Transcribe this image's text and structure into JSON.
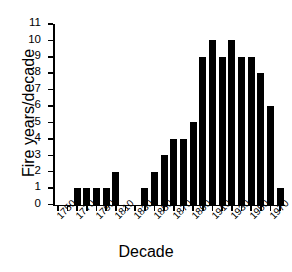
{
  "chart_data": {
    "type": "bar",
    "title": "",
    "xlabel": "Decade",
    "ylabel": "Fire years/decade",
    "categories": [
      1750,
      1760,
      1770,
      1780,
      1790,
      1800,
      1810,
      1820,
      1830,
      1840,
      1850,
      1860,
      1870,
      1880,
      1890,
      1900,
      1910,
      1920,
      1930,
      1940,
      1950,
      1960,
      1970,
      1980
    ],
    "values": [
      0,
      0,
      1,
      1,
      1,
      1,
      2,
      0,
      0,
      1,
      2,
      3,
      4,
      4,
      5,
      9,
      10,
      9,
      10,
      9,
      9,
      8,
      6,
      1
    ],
    "ylim": [
      0,
      11
    ],
    "xlim": [
      1745,
      1985
    ],
    "ytick_labels": [
      "0",
      "1",
      "2",
      "3",
      "4",
      "5",
      "6",
      "7",
      "8",
      "9",
      "10",
      "11"
    ],
    "ytick_values": [
      0,
      1,
      2,
      3,
      4,
      5,
      6,
      7,
      8,
      9,
      10,
      11
    ],
    "xtick_values": [
      1750,
      1760,
      1770,
      1780,
      1790,
      1800,
      1810,
      1820,
      1830,
      1840,
      1850,
      1860,
      1870,
      1880,
      1890,
      1900,
      1910,
      1920,
      1930,
      1940,
      1950,
      1960,
      1970,
      1980
    ],
    "xtick_labels_shown": [
      "1750",
      "1770",
      "1790",
      "1810",
      "1830",
      "1850",
      "1870",
      "1890",
      "1910",
      "1930",
      "1950",
      "1970"
    ],
    "grid": false,
    "legend": null,
    "bar_color": "#000000",
    "axis_color": "#000000",
    "xtick_label_rotation": -45
  }
}
